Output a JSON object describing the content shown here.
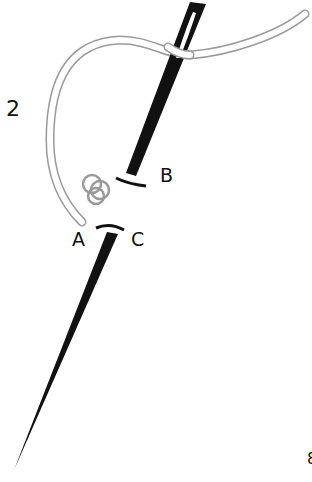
{
  "figure": {
    "step_number": "2",
    "labels": {
      "a": "A",
      "b": "B",
      "c": "C"
    },
    "edge_mark": "8"
  },
  "colors": {
    "needle": "#111111",
    "thread_outline": "#9a9a9a",
    "thread_fill": "#ffffff",
    "background": "#ffffff"
  }
}
